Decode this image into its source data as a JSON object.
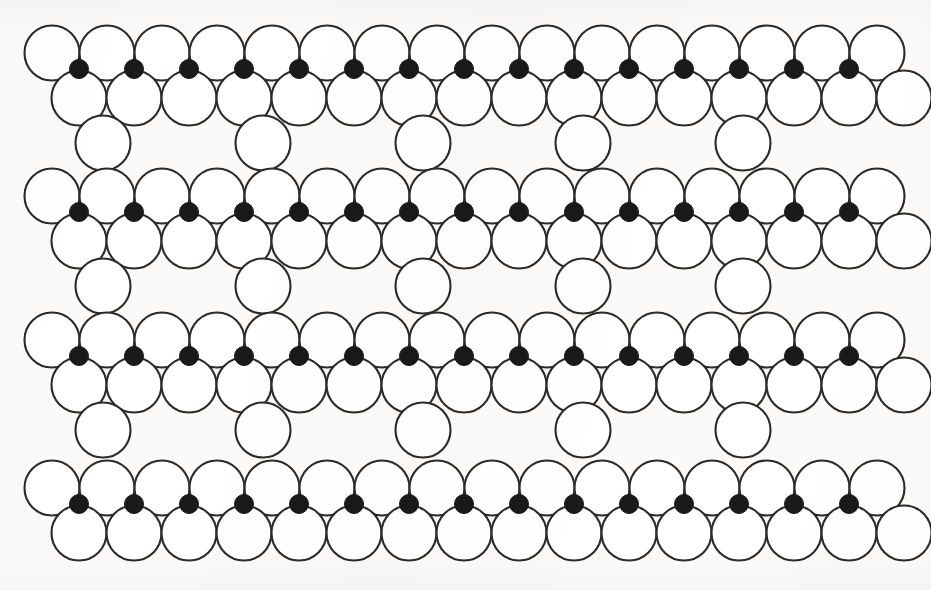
{
  "figure": {
    "width": 931,
    "height": 590,
    "background_color": "#fbfaf8",
    "outline_color": "#2b2b2b",
    "interstitial_color": "#1a1a1a",
    "sphere_fill": "#ffffff",
    "stroke_width": 2.1,
    "large_radius": 27.5,
    "small_radius": 9.5,
    "column_spacing": 55,
    "sparse_spacing": 160
  },
  "legend": {
    "large_sphere_label": "large sphere (open circle)",
    "small_sphere_label": "interstitial sphere (filled circle)"
  },
  "chart_data": {
    "type": "scatter",
    "xlabel": "",
    "ylabel": "",
    "xlim": [
      0,
      931
    ],
    "ylim": [
      0,
      590
    ],
    "grid": false,
    "legend_position": "none",
    "series": [
      {
        "name": "large-spheres",
        "marker": "open-circle",
        "radius": 27.5,
        "count": 214,
        "rows": [
          {
            "row_id": "band1-row1",
            "cy": 53,
            "x_start": 52,
            "count": 16,
            "step": 55
          },
          {
            "row_id": "band1-row2",
            "cy": 98,
            "x_start": 79,
            "count": 16,
            "step": 55
          },
          {
            "row_id": "band1-row3",
            "cy": 143,
            "x_start": 103,
            "count": 5,
            "step": 160
          },
          {
            "row_id": "band2-row1",
            "cy": 196,
            "x_start": 52,
            "count": 16,
            "step": 55
          },
          {
            "row_id": "band2-row2",
            "cy": 241,
            "x_start": 79,
            "count": 16,
            "step": 55
          },
          {
            "row_id": "band2-row3",
            "cy": 286,
            "x_start": 103,
            "count": 5,
            "step": 160
          },
          {
            "row_id": "band3-row1",
            "cy": 340,
            "x_start": 52,
            "count": 16,
            "step": 55
          },
          {
            "row_id": "band3-row2",
            "cy": 385,
            "x_start": 79,
            "count": 16,
            "step": 55
          },
          {
            "row_id": "band3-row3",
            "cy": 430,
            "x_start": 103,
            "count": 5,
            "step": 160
          },
          {
            "row_id": "band4-row1",
            "cy": 488,
            "x_start": 52,
            "count": 16,
            "step": 55
          },
          {
            "row_id": "band4-row2",
            "cy": 533,
            "x_start": 79,
            "count": 16,
            "step": 55
          }
        ]
      },
      {
        "name": "interstitial-spheres",
        "marker": "filled-circle",
        "radius": 9.5,
        "count": 60,
        "rows": [
          {
            "row_id": "band1-dots",
            "cy": 69,
            "x_start": 79,
            "count": 15,
            "step": 55
          },
          {
            "row_id": "band2-dots",
            "cy": 212,
            "x_start": 79,
            "count": 15,
            "step": 55
          },
          {
            "row_id": "band3-dots",
            "cy": 356,
            "x_start": 79,
            "count": 15,
            "step": 55
          },
          {
            "row_id": "band4-dots",
            "cy": 504,
            "x_start": 79,
            "count": 15,
            "step": 55
          }
        ]
      }
    ]
  }
}
